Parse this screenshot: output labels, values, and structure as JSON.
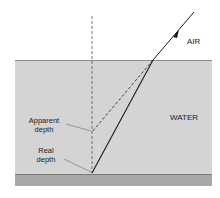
{
  "diagram": {
    "labels": {
      "air": "AIR",
      "water": "WATER",
      "apparent_line1": "Apparent",
      "apparent_line2": "depth",
      "real_line1": "Real",
      "real_line2": "depth"
    },
    "colors": {
      "water": "#d4d4d4",
      "bottom": "#a8a8a8",
      "surface": "#8c8c8c",
      "ray": "#1a1a1a"
    }
  }
}
